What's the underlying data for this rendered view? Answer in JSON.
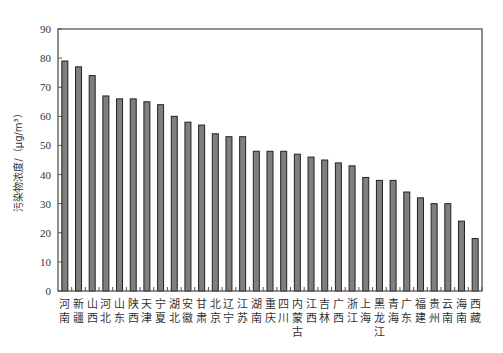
{
  "chart_data": {
    "type": "bar",
    "title": "",
    "xlabel": "",
    "ylabel": "污染物浓度/（μg/m³）",
    "ylim": [
      0,
      90
    ],
    "yticks": [
      0,
      10,
      20,
      30,
      40,
      50,
      60,
      70,
      80,
      90
    ],
    "grid": false,
    "legend": null,
    "bar_color": "#7f7f7f",
    "bar_edge_color": "#222222",
    "categories": [
      "河南",
      "新疆",
      "山西",
      "河北",
      "山东",
      "陕西",
      "天津",
      "宁夏",
      "湖北",
      "安徽",
      "甘肃",
      "北京",
      "辽宁",
      "江苏",
      "湖南",
      "重庆",
      "四川",
      "内蒙古",
      "江西",
      "吉林",
      "广西",
      "浙江",
      "上海",
      "黑龙江",
      "青海",
      "广东",
      "福建",
      "贵州",
      "云南",
      "海南",
      "西藏"
    ],
    "values": [
      79,
      77,
      74,
      67,
      66,
      66,
      65,
      64,
      60,
      58,
      57,
      54,
      53,
      53,
      48,
      48,
      48,
      47,
      46,
      45,
      44,
      43,
      39,
      38,
      38,
      34,
      32,
      30,
      30,
      24,
      18
    ]
  }
}
